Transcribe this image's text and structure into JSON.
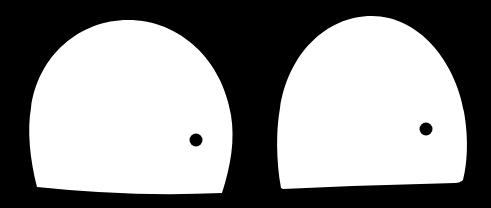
{
  "scene": {
    "background_color": "#000000",
    "shape_color": "#ffffff",
    "dot_color": "#000000",
    "shapes": [
      {
        "label": "left-dome",
        "path": "M 37 187 C 30 160 27 130 31 108 C 38 55 80 20 128 20 C 180 20 222 60 231 115 C 235 140 231 165 222 193 Q 130 197 37 187 Z",
        "dot": {
          "cx": 196,
          "cy": 140,
          "r": 6.5
        }
      },
      {
        "label": "right-dome",
        "path": "M 281 188 C 276 160 276 130 280 108 C 288 55 325 16 372 16 C 418 16 455 60 464 112 C 469 140 467 165 463 180 Q 460 183 455 183 Q 370 185 283 189 Z",
        "dot": {
          "cx": 426,
          "cy": 129,
          "r": 6.5
        }
      }
    ]
  }
}
